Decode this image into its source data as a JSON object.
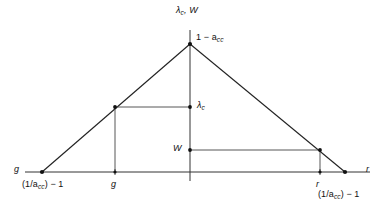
{
  "figure": {
    "type": "diagram",
    "background": "#ffffff",
    "line_color": "#222222",
    "width": 385,
    "height": 207,
    "labels": {
      "axis_top": "λ_c , W",
      "apex": "1 − a_cc",
      "lambda_c": "λ_c",
      "w": "W",
      "g_axis": "g",
      "g_corner": "(1/a_cc) − 1",
      "g_tick": "g",
      "r_tick": "r",
      "r_axis": "r",
      "r_corner": "(1/a_cc) − 1"
    },
    "label_parts": {
      "axis_top": {
        "lead": "λ",
        "sub": "c",
        "tail": ", W"
      },
      "apex": {
        "lead": "1 − a",
        "sub": "cc"
      },
      "lambda_c": {
        "lead": "λ",
        "sub": "c"
      },
      "corner": {
        "lead": "(1/a",
        "sub": "cc",
        "tail": ") − 1"
      }
    },
    "geometry": {
      "baseline_y": 172,
      "baseline_x1": 25,
      "baseline_x2": 370,
      "vaxis_x": 190,
      "vaxis_y1": 30,
      "vaxis_y2": 181,
      "left_vertex": [
        42,
        172
      ],
      "apex": [
        190,
        44
      ],
      "right_vertex": [
        345,
        172
      ],
      "lambda_line_y": 107,
      "lambda_line_x1": 115,
      "lambda_line_x2": 190,
      "lambda_drop_x": 115,
      "w_line_y": 150,
      "w_line_x1": 190,
      "w_line_x2": 320,
      "w_drop_x": 320
    },
    "markers": [
      {
        "name": "apex-point",
        "x": 190,
        "y": 44
      },
      {
        "name": "left-vertex-point",
        "x": 42,
        "y": 172
      },
      {
        "name": "right-vertex-point",
        "x": 345,
        "y": 172
      },
      {
        "name": "lambda-left-point",
        "x": 115,
        "y": 107
      },
      {
        "name": "lambda-axis-point",
        "x": 190,
        "y": 107
      },
      {
        "name": "w-right-point",
        "x": 320,
        "y": 150
      },
      {
        "name": "w-axis-point",
        "x": 190,
        "y": 150
      },
      {
        "name": "g-baseline-point",
        "x": 115,
        "y": 172
      },
      {
        "name": "r-baseline-point",
        "x": 320,
        "y": 172
      }
    ]
  }
}
